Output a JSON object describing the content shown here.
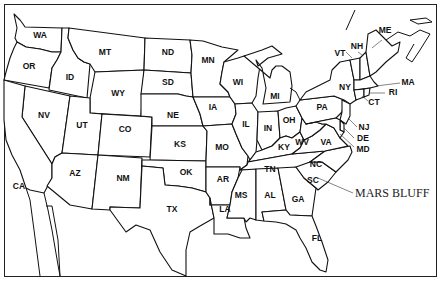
{
  "map": {
    "title": "",
    "callout": {
      "label": "MARS BLUFF",
      "state": "SC"
    },
    "states": [
      {
        "abbr": "WA"
      },
      {
        "abbr": "OR"
      },
      {
        "abbr": "CA"
      },
      {
        "abbr": "ID"
      },
      {
        "abbr": "NV"
      },
      {
        "abbr": "MT"
      },
      {
        "abbr": "WY"
      },
      {
        "abbr": "UT"
      },
      {
        "abbr": "AZ"
      },
      {
        "abbr": "CO"
      },
      {
        "abbr": "NM"
      },
      {
        "abbr": "ND"
      },
      {
        "abbr": "SD"
      },
      {
        "abbr": "NE"
      },
      {
        "abbr": "KS"
      },
      {
        "abbr": "OK"
      },
      {
        "abbr": "TX"
      },
      {
        "abbr": "MN"
      },
      {
        "abbr": "IA"
      },
      {
        "abbr": "MO"
      },
      {
        "abbr": "AR"
      },
      {
        "abbr": "LA"
      },
      {
        "abbr": "WI"
      },
      {
        "abbr": "IL"
      },
      {
        "abbr": "MS"
      },
      {
        "abbr": "MI"
      },
      {
        "abbr": "IN"
      },
      {
        "abbr": "KY"
      },
      {
        "abbr": "TN"
      },
      {
        "abbr": "AL"
      },
      {
        "abbr": "OH"
      },
      {
        "abbr": "WV"
      },
      {
        "abbr": "VA"
      },
      {
        "abbr": "NC"
      },
      {
        "abbr": "SC"
      },
      {
        "abbr": "GA"
      },
      {
        "abbr": "FL"
      },
      {
        "abbr": "PA"
      },
      {
        "abbr": "NY"
      },
      {
        "abbr": "VT"
      },
      {
        "abbr": "NH"
      },
      {
        "abbr": "ME"
      },
      {
        "abbr": "MA"
      },
      {
        "abbr": "RI"
      },
      {
        "abbr": "CT"
      },
      {
        "abbr": "NJ"
      },
      {
        "abbr": "DE"
      },
      {
        "abbr": "MD"
      }
    ]
  }
}
